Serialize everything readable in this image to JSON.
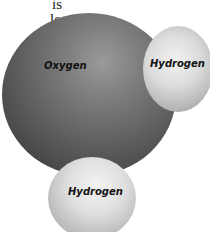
{
  "text_fragments": {
    "line1": "is",
    "line2": "le-",
    "line3": ","
  },
  "diagram": {
    "atoms": [
      {
        "id": "oxygen",
        "label": "Oxygen",
        "color": "#5e5e5e"
      },
      {
        "id": "hydrogen-right",
        "label": "Hydrogen",
        "color": "#dcdcdc"
      },
      {
        "id": "hydrogen-bottom",
        "label": "Hydrogen",
        "color": "#dcdcdc"
      }
    ]
  }
}
